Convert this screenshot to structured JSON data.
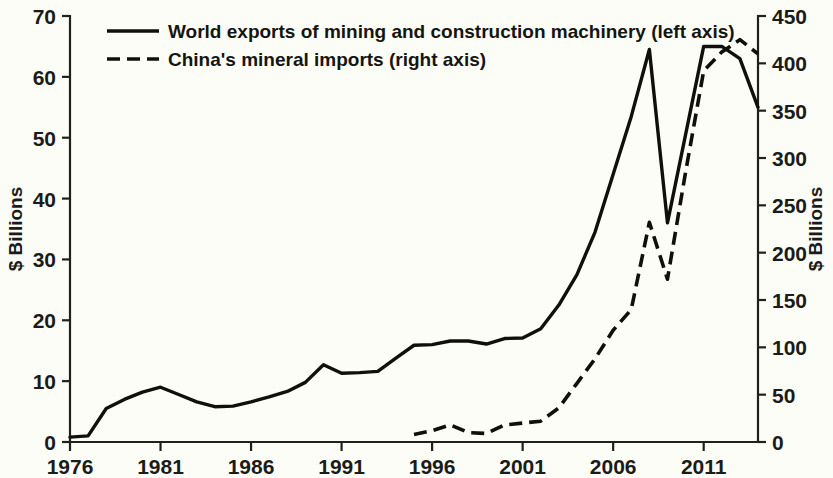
{
  "chart_data": {
    "type": "line",
    "title": "",
    "subtitle": "",
    "xlabel": "",
    "ylabel": "$ Billions",
    "y2label": "$ Billions",
    "grid": false,
    "legend_position": "top-left",
    "x": [
      1976,
      1977,
      1978,
      1979,
      1980,
      1981,
      1982,
      1983,
      1984,
      1985,
      1986,
      1987,
      1988,
      1989,
      1990,
      1991,
      1992,
      1993,
      1994,
      1995,
      1996,
      1997,
      1998,
      1999,
      2000,
      2001,
      2002,
      2003,
      2004,
      2005,
      2006,
      2007,
      2008,
      2009,
      2010,
      2011,
      2012,
      2013,
      2014
    ],
    "xlim": [
      1976,
      2014
    ],
    "xticks": [
      1976,
      1981,
      1986,
      1991,
      1996,
      2001,
      2006,
      2011
    ],
    "xtick_labels": [
      "1976",
      "1981",
      "1986",
      "1991",
      "1996",
      "2001",
      "2006",
      "2011"
    ],
    "ylim": [
      0,
      70
    ],
    "yticks": [
      0,
      10,
      20,
      30,
      40,
      50,
      60,
      70
    ],
    "ytick_labels": [
      "0",
      "10",
      "20",
      "30",
      "40",
      "50",
      "60",
      "70"
    ],
    "y2lim": [
      0,
      450
    ],
    "y2ticks": [
      0,
      50,
      100,
      150,
      200,
      250,
      300,
      350,
      400,
      450
    ],
    "y2tick_labels": [
      "0",
      "50",
      "100",
      "150",
      "200",
      "250",
      "300",
      "350",
      "400",
      "450"
    ],
    "series": [
      {
        "name": "World exports of mining and construction machinery (left axis)",
        "axis": "left",
        "style": "solid",
        "x": [
          1976,
          1977,
          1978,
          1979,
          1980,
          1981,
          1982,
          1983,
          1984,
          1985,
          1986,
          1987,
          1988,
          1989,
          1990,
          1991,
          1992,
          1993,
          1994,
          1995,
          1996,
          1997,
          1998,
          1999,
          2000,
          2001,
          2002,
          2003,
          2004,
          2005,
          2006,
          2007,
          2008,
          2009,
          2010,
          2011,
          2012,
          2013,
          2014
        ],
        "values": [
          0.8,
          1.0,
          5.5,
          7.0,
          8.2,
          9.0,
          7.8,
          6.6,
          5.8,
          5.9,
          6.6,
          7.4,
          8.3,
          9.8,
          12.7,
          11.3,
          11.4,
          11.6,
          13.8,
          15.9,
          16.0,
          16.6,
          16.6,
          16.1,
          17.0,
          17.1,
          18.6,
          22.5,
          27.5,
          34.5,
          44.0,
          53.5,
          64.5,
          36.0,
          50.5,
          65.0,
          65.0,
          63.0,
          55.0
        ]
      },
      {
        "name": "China's mineral imports (right axis)",
        "axis": "right",
        "style": "dashed",
        "x": [
          1995,
          1996,
          1997,
          1998,
          1999,
          2000,
          2001,
          2002,
          2003,
          2004,
          2005,
          2006,
          2007,
          2008,
          2009,
          2010,
          2011,
          2012,
          2013,
          2014
        ],
        "values": [
          8,
          12,
          18,
          10,
          9,
          18,
          20,
          22,
          36,
          62,
          88,
          118,
          140,
          232,
          172,
          285,
          392,
          412,
          425,
          410
        ]
      }
    ],
    "legend": [
      {
        "label": "World exports of mining and construction machinery (left axis)",
        "style": "solid"
      },
      {
        "label": "China's mineral imports (right axis)",
        "style": "dashed"
      }
    ]
  }
}
